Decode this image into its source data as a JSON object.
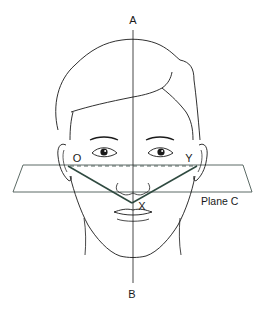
{
  "figure": {
    "labels": {
      "top_axis": "A",
      "bottom_axis": "B",
      "left_point": "O",
      "right_point": "Y",
      "vertex_point": "X",
      "plane": "Plane C"
    },
    "colors": {
      "outline": "#1a1a1a",
      "plane": "#4a5a55",
      "vector_lines": "#2f4a40",
      "background": "#ffffff"
    }
  }
}
